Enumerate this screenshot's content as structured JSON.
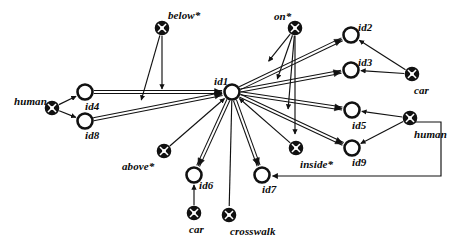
{
  "diagram": {
    "colors": {
      "stroke": "#111111",
      "fill": "#ffffff",
      "text": "#0a0a0a"
    },
    "node_types": {
      "instance": "open-circle-node",
      "concept": "crossed-circle-node"
    },
    "nodes": [
      {
        "id": "id1",
        "label": "id1",
        "type": "instance",
        "x": 232,
        "y": 92,
        "r": 7.5,
        "lx": 214,
        "ly": 76
      },
      {
        "id": "id2",
        "label": "id2",
        "type": "instance",
        "x": 351,
        "y": 35,
        "r": 7.5,
        "lx": 358,
        "ly": 22
      },
      {
        "id": "id3",
        "label": "id3",
        "type": "instance",
        "x": 351,
        "y": 70,
        "r": 7.5,
        "lx": 358,
        "ly": 57
      },
      {
        "id": "id4",
        "label": "id4",
        "type": "instance",
        "x": 85,
        "y": 92,
        "r": 7.5,
        "lx": 85,
        "ly": 101
      },
      {
        "id": "id5",
        "label": "id5",
        "type": "instance",
        "x": 352,
        "y": 110,
        "r": 7.5,
        "lx": 352,
        "ly": 120
      },
      {
        "id": "id6",
        "label": "id6",
        "type": "instance",
        "x": 194,
        "y": 175,
        "r": 7.5,
        "lx": 199,
        "ly": 180
      },
      {
        "id": "id7",
        "label": "id7",
        "type": "instance",
        "x": 262,
        "y": 175,
        "r": 7.5,
        "lx": 262,
        "ly": 184
      },
      {
        "id": "id8",
        "label": "id8",
        "type": "instance",
        "x": 85,
        "y": 121,
        "r": 7.5,
        "lx": 85,
        "ly": 130
      },
      {
        "id": "id9",
        "label": "id9",
        "type": "instance",
        "x": 352,
        "y": 148,
        "r": 7.5,
        "lx": 352,
        "ly": 157
      },
      {
        "id": "below",
        "label": "below*",
        "type": "concept",
        "x": 162,
        "y": 28,
        "r": 6.5,
        "lx": 168,
        "ly": 10
      },
      {
        "id": "on",
        "label": "on*",
        "type": "concept",
        "x": 295,
        "y": 28,
        "r": 6.5,
        "lx": 274,
        "ly": 11
      },
      {
        "id": "above",
        "label": "above*",
        "type": "concept",
        "x": 164,
        "y": 151,
        "r": 6.5,
        "lx": 122,
        "ly": 161
      },
      {
        "id": "inside",
        "label": "inside*",
        "type": "concept",
        "x": 296,
        "y": 148,
        "r": 6.5,
        "lx": 300,
        "ly": 159
      },
      {
        "id": "humanL",
        "label": "human",
        "type": "concept",
        "x": 52,
        "y": 108,
        "r": 6.5,
        "lx": 14,
        "ly": 96
      },
      {
        "id": "humanR",
        "label": "human",
        "type": "concept",
        "x": 410,
        "y": 118,
        "r": 6.5,
        "lx": 414,
        "ly": 129
      },
      {
        "id": "carR",
        "label": "car",
        "type": "concept",
        "x": 412,
        "y": 74,
        "r": 6.5,
        "lx": 414,
        "ly": 85
      },
      {
        "id": "carB",
        "label": "car",
        "type": "concept",
        "x": 194,
        "y": 213,
        "r": 6.5,
        "lx": 189,
        "ly": 224
      },
      {
        "id": "crosswalk",
        "label": "crosswalk",
        "type": "concept",
        "x": 229,
        "y": 215,
        "r": 6.5,
        "lx": 230,
        "ly": 226
      }
    ],
    "edges": [
      {
        "from": "id4",
        "to": "id1",
        "style": "double",
        "arrow": true
      },
      {
        "from": "id8",
        "to": "id1",
        "style": "double",
        "arrow": true
      },
      {
        "from": "humanL",
        "to": "id4",
        "style": "single",
        "arrow": true
      },
      {
        "from": "humanL",
        "to": "id8",
        "style": "single",
        "arrow": true
      },
      {
        "from": "id1",
        "to": "id2",
        "style": "double",
        "arrow": true
      },
      {
        "from": "id1",
        "to": "id3",
        "style": "double",
        "arrow": true
      },
      {
        "from": "id1",
        "to": "id5",
        "style": "double",
        "arrow": true
      },
      {
        "from": "id1",
        "to": "id9",
        "style": "double",
        "arrow": true
      },
      {
        "from": "id1",
        "to": "id6",
        "style": "double",
        "arrow": true
      },
      {
        "from": "id1",
        "to": "id7",
        "style": "double",
        "arrow": true
      },
      {
        "from": "id1",
        "to": "crosswalk",
        "style": "single",
        "arrow": false
      },
      {
        "from": "carR",
        "to": "id2",
        "style": "single",
        "arrow": true
      },
      {
        "from": "carR",
        "to": "id3",
        "style": "single",
        "arrow": true
      },
      {
        "from": "humanR",
        "to": "id5",
        "style": "single",
        "arrow": true
      },
      {
        "from": "humanR",
        "to": "id9",
        "style": "single",
        "arrow": true
      },
      {
        "from": "humanR",
        "to": "id7",
        "style": "elbow",
        "arrow": true
      },
      {
        "from": "above",
        "to": "id1",
        "style": "single",
        "arrow": true
      },
      {
        "from": "inside",
        "to": "id1",
        "style": "single",
        "arrow": true
      },
      {
        "from": "carB",
        "to": "id6",
        "style": "single",
        "arrow": true
      },
      {
        "from": "below",
        "to": "fan1",
        "style": "single",
        "arrow": true
      },
      {
        "from": "below",
        "to": "fan2",
        "style": "single",
        "arrow": true
      },
      {
        "from": "on",
        "to": "fan3",
        "style": "single",
        "arrow": true
      },
      {
        "from": "on",
        "to": "fan4",
        "style": "single",
        "arrow": true
      },
      {
        "from": "on",
        "to": "fan5",
        "style": "single",
        "arrow": true
      },
      {
        "from": "on",
        "to": "fan6",
        "style": "single",
        "arrow": true
      }
    ]
  }
}
